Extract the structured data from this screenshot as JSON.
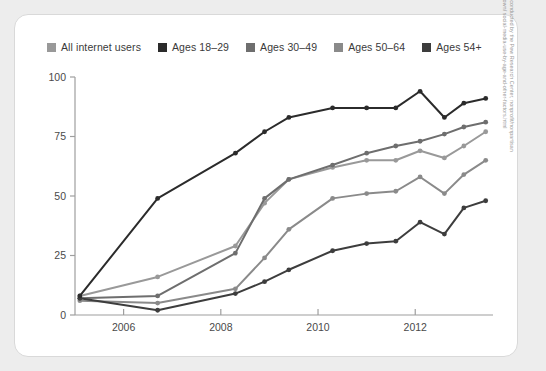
{
  "legend": {
    "items": [
      {
        "label": "All internet users",
        "color": "#999999",
        "swatch": "legend-swatch-all-internet-users"
      },
      {
        "label": "Ages 18–29",
        "color": "#2b2b2b",
        "swatch": "legend-swatch-ages-18-29"
      },
      {
        "label": "Ages 30–49",
        "color": "#6e6e6e",
        "swatch": "legend-swatch-ages-30-49"
      },
      {
        "label": "Ages 50–64",
        "color": "#8a8a8a",
        "swatch": "legend-swatch-ages-50-64"
      },
      {
        "label": "Ages 54+",
        "color": "#3d3d3d",
        "swatch": "legend-swatch-ages-54-plus"
      }
    ]
  },
  "axes": {
    "y_ticks": [
      "0",
      "25",
      "50",
      "75",
      "100"
    ],
    "x_ticks": [
      "2006",
      "2008",
      "2010",
      "2012"
    ]
  },
  "side_note": "Based on surveys conducted by the Pew Research Center, nonprofit/nonpartisan research-breaks-down/ social-media-use-by-age-and-other-factors.html",
  "chart_data": {
    "type": "line",
    "title": "",
    "xlabel": "",
    "ylabel": "",
    "xlim": [
      2005.0,
      2013.6
    ],
    "ylim": [
      0,
      100
    ],
    "grid": false,
    "legend_position": "top",
    "x_tick_values": [
      2006,
      2008,
      2010,
      2012
    ],
    "y_tick_values": [
      0,
      25,
      50,
      75,
      100
    ],
    "x": [
      2005.1,
      2006.7,
      2008.3,
      2008.9,
      2009.4,
      2010.3,
      2011.0,
      2011.6,
      2012.1,
      2012.6,
      2013.0,
      2013.45
    ],
    "series": [
      {
        "name": "All internet users",
        "color": "#999999",
        "values": [
          8,
          16,
          29,
          47,
          57,
          62,
          65,
          65,
          69,
          66,
          71,
          77
        ]
      },
      {
        "name": "Ages 18–29",
        "color": "#2b2b2b",
        "values": [
          8,
          49,
          68,
          77,
          83,
          87,
          87,
          87,
          94,
          83,
          89,
          91
        ]
      },
      {
        "name": "Ages 30–49",
        "color": "#6e6e6e",
        "values": [
          7,
          8,
          26,
          49,
          57,
          63,
          68,
          71,
          73,
          76,
          79,
          81
        ]
      },
      {
        "name": "Ages 50–64",
        "color": "#8a8a8a",
        "values": [
          6,
          5,
          11,
          24,
          36,
          49,
          51,
          52,
          58,
          51,
          59,
          65
        ]
      },
      {
        "name": "Ages 54+",
        "color": "#3d3d3d",
        "values": [
          7,
          2,
          9,
          14,
          19,
          27,
          30,
          31,
          39,
          34,
          45,
          48
        ]
      }
    ]
  }
}
